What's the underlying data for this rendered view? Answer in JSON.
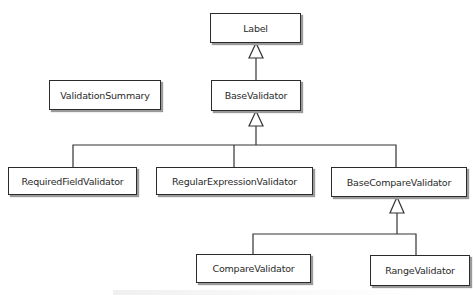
{
  "diagram": {
    "type": "class-hierarchy",
    "nodes": {
      "label": {
        "text": "Label"
      },
      "validation_summary": {
        "text": "ValidationSummary"
      },
      "base_validator": {
        "text": "BaseValidator"
      },
      "required_field_validator": {
        "text": "RequiredFieldValidator"
      },
      "regular_expression_validator": {
        "text": "RegularExpressionValidator"
      },
      "base_compare_validator": {
        "text": "BaseCompareValidator"
      },
      "compare_validator": {
        "text": "CompareValidator"
      },
      "range_validator": {
        "text": "RangeValidator"
      }
    },
    "edges": [
      {
        "from": "BaseValidator",
        "to": "Label",
        "kind": "inheritance"
      },
      {
        "from": "RequiredFieldValidator",
        "to": "BaseValidator",
        "kind": "inheritance"
      },
      {
        "from": "RegularExpressionValidator",
        "to": "BaseValidator",
        "kind": "inheritance"
      },
      {
        "from": "BaseCompareValidator",
        "to": "BaseValidator",
        "kind": "inheritance"
      },
      {
        "from": "CompareValidator",
        "to": "BaseCompareValidator",
        "kind": "inheritance"
      },
      {
        "from": "RangeValidator",
        "to": "BaseCompareValidator",
        "kind": "inheritance"
      }
    ]
  },
  "colors": {
    "line": "#333333",
    "box_border": "#2b2b2b",
    "shadow": "#9a9a9a",
    "text": "#2a2a2a",
    "background": "#ffffff"
  }
}
